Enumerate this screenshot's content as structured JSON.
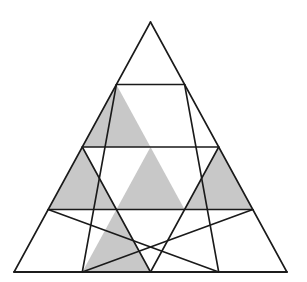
{
  "diagram": {
    "rows": 4,
    "apex": [
      150.5,
      22
    ],
    "row_height": 62.5,
    "half_step": 34.1,
    "colors": {
      "fill": "#c8c8c8",
      "stroke": "#1a1a1a",
      "background": "#ffffff"
    },
    "shaded_up_cells": [
      {
        "row": 2,
        "index": 1
      },
      {
        "row": 3,
        "index": 1
      },
      {
        "row": 3,
        "index": 2
      },
      {
        "row": 3,
        "index": 3
      },
      {
        "row": 4,
        "index": 2
      }
    ]
  }
}
